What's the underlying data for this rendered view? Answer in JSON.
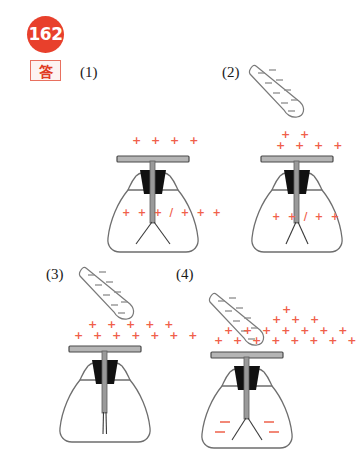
{
  "header": {
    "problem_number": "162",
    "answer_label": "答"
  },
  "colors": {
    "badge_bg": "#e8402c",
    "badge_text": "#ffffff",
    "answer_border": "#e8705f",
    "answer_text": "#e03b22",
    "positive_charge": "#f0604a",
    "negative_charge_rod": "#8c8c8c",
    "negative_charge_leaf": "#ef6a55",
    "glass_outline": "#6b6b6b",
    "stopper": "#111111",
    "metal": "#8a8a8a"
  },
  "panels": [
    {
      "label": "(1)",
      "rod_present": false,
      "rod_charges": "",
      "plate_charges_rows": [
        "+ + + +"
      ],
      "leaf_state": "spread-wide",
      "leaf_charges": "+ + + / + + +",
      "leaf_charge_sign": "+"
    },
    {
      "label": "(2)",
      "rod_present": true,
      "rod_charges": "-",
      "plate_charges_rows": [
        "+ +",
        "+ + + +"
      ],
      "leaf_state": "spread-medium",
      "leaf_charges": "+ + / + +",
      "leaf_charge_sign": "+"
    },
    {
      "label": "(3)",
      "rod_present": true,
      "rod_charges": "-",
      "plate_charges_rows": [
        "+ + + + +",
        "+ + + + + + +"
      ],
      "leaf_state": "closed",
      "leaf_charges": "",
      "leaf_charge_sign": ""
    },
    {
      "label": "(4)",
      "rod_present": true,
      "rod_charges": "-",
      "plate_charges_rows": [
        "+",
        "+ + +",
        "+ + + + + + +",
        "+ + + + + + + +"
      ],
      "leaf_state": "spread-wide",
      "leaf_charges": "- - - -",
      "leaf_charge_sign": "-"
    }
  ]
}
